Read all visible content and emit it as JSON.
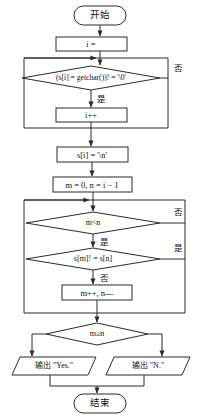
{
  "diagram": {
    "type": "flowchart",
    "stroke_color": "#2b2b2b",
    "fill_color": "#ffffff",
    "text_color": "#111111",
    "nodes": [
      {
        "id": "start",
        "shape": "terminator",
        "text": "开始"
      },
      {
        "id": "init_i",
        "shape": "process",
        "text": "i ="
      },
      {
        "id": "read_cond",
        "shape": "decision",
        "text": "(s[i] = getchar())! = '\\0'"
      },
      {
        "id": "inc_i",
        "shape": "process",
        "text": "i++"
      },
      {
        "id": "set_nl",
        "shape": "process",
        "text": "s[i] = '\\n'"
      },
      {
        "id": "init_mn",
        "shape": "process",
        "text": "m = 0, n = i − 1"
      },
      {
        "id": "cmp_mn",
        "shape": "decision",
        "text": "m<n"
      },
      {
        "id": "cmp_sms",
        "shape": "decision",
        "text": "s[m]! = s[n]"
      },
      {
        "id": "step_mn",
        "shape": "process",
        "text": "m++, n—"
      },
      {
        "id": "cmp_ge",
        "shape": "decision",
        "text": "m≥n"
      },
      {
        "id": "out_yes",
        "shape": "parallelogram",
        "text": "输出 \"Yes.\""
      },
      {
        "id": "out_no",
        "shape": "parallelogram",
        "text": "输出 \"N.\""
      },
      {
        "id": "end",
        "shape": "terminator",
        "text": "结束"
      }
    ],
    "branch_labels": {
      "read_cond_no": "否",
      "read_cond_yes": "是",
      "cmp_mn_no": "否",
      "cmp_mn_yes": "是",
      "cmp_sms_yes": "是",
      "cmp_sms_no": "否"
    }
  }
}
